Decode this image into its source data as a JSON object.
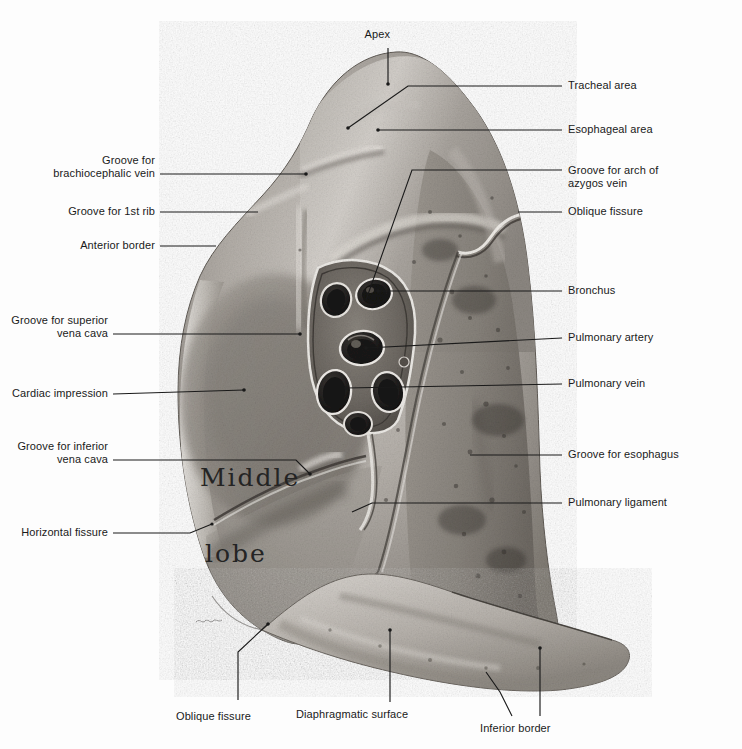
{
  "figure": {
    "background_color": "#fdfdfd",
    "leader_color": "#1a1a1a",
    "text_color": "#1a1a1a"
  },
  "handwritten": {
    "line1": "Middle",
    "line2": "lobe"
  },
  "labels": {
    "apex": "Apex",
    "tracheal_area": "Tracheal area",
    "esophageal_area": "Esophageal area",
    "groove_brachiocephalic_vein_1": "Groove for",
    "groove_brachiocephalic_vein_2": "brachiocephalic vein",
    "groove_arch_azygos_1": "Groove for arch of",
    "groove_arch_azygos_2": "azygos vein",
    "oblique_fissure_top": "Oblique fissure",
    "groove_first_rib": "Groove for 1st rib",
    "anterior_border": "Anterior border",
    "bronchus": "Bronchus",
    "groove_superior_vena_cava_1": "Groove for superior",
    "groove_superior_vena_cava_2": "vena cava",
    "pulmonary_artery": "Pulmonary artery",
    "cardiac_impression": "Cardiac impression",
    "pulmonary_vein": "Pulmonary vein",
    "groove_inferior_vena_cava_1": "Groove for inferior",
    "groove_inferior_vena_cava_2": "vena cava",
    "groove_esophagus": "Groove for esophagus",
    "pulmonary_ligament": "Pulmonary ligament",
    "horizontal_fissure": "Horizontal fissure",
    "oblique_fissure_bottom": "Oblique fissure",
    "diaphragmatic_surface": "Diaphragmatic surface",
    "inferior_border": "Inferior border"
  }
}
